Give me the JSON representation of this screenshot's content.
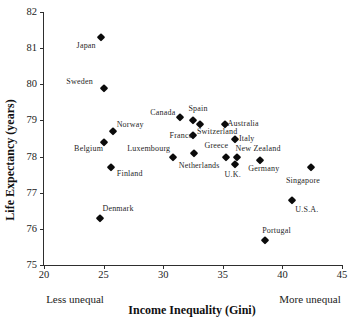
{
  "chart_data": {
    "type": "scatter",
    "title": "",
    "xlabel": "Income Inequality (Gini)",
    "ylabel": "Life Expectancy (years)",
    "x_annotation_left": "Less unequal",
    "x_annotation_right": "More unequal",
    "xlim": [
      20,
      45
    ],
    "ylim": [
      75,
      82
    ],
    "x_ticks": [
      20,
      25,
      30,
      35,
      40,
      45
    ],
    "y_ticks": [
      75,
      76,
      77,
      78,
      79,
      80,
      81,
      82
    ],
    "grid": false,
    "legend": false,
    "marker": {
      "shape": "diamond",
      "color": "#0b0b0b"
    },
    "axis_color": "#2e2e2e",
    "points": [
      {
        "country": "Japan",
        "gini": 24.8,
        "life_expectancy": 81.3,
        "label_dx": -15,
        "label_dy": 9
      },
      {
        "country": "Sweden",
        "gini": 25.0,
        "life_expectancy": 79.9,
        "label_dx": -24,
        "label_dy": -6
      },
      {
        "country": "Norway",
        "gini": 25.8,
        "life_expectancy": 78.7,
        "label_dx": 17,
        "label_dy": -6
      },
      {
        "country": "Belgium",
        "gini": 25.0,
        "life_expectancy": 78.4,
        "label_dx": -15,
        "label_dy": 7
      },
      {
        "country": "Finland",
        "gini": 25.6,
        "life_expectancy": 77.7,
        "label_dx": 19,
        "label_dy": 7
      },
      {
        "country": "Denmark",
        "gini": 24.7,
        "life_expectancy": 76.3,
        "label_dx": 18,
        "label_dy": -9
      },
      {
        "country": "Canada",
        "gini": 31.4,
        "life_expectancy": 79.1,
        "label_dx": -17,
        "label_dy": -4
      },
      {
        "country": "Spain",
        "gini": 32.5,
        "life_expectancy": 79.0,
        "label_dx": 5,
        "label_dy": -11
      },
      {
        "country": "Switzerland",
        "gini": 33.1,
        "life_expectancy": 78.9,
        "label_dx": 17,
        "label_dy": 8
      },
      {
        "country": "France",
        "gini": 32.5,
        "life_expectancy": 78.6,
        "label_dx": -12,
        "label_dy": 1
      },
      {
        "country": "Australia",
        "gini": 35.2,
        "life_expectancy": 78.9,
        "label_dx": 18,
        "label_dy": 0
      },
      {
        "country": "Italy",
        "gini": 36.0,
        "life_expectancy": 78.5,
        "label_dx": 12,
        "label_dy": 0
      },
      {
        "country": "Luxembourg",
        "gini": 30.8,
        "life_expectancy": 78.0,
        "label_dx": -24,
        "label_dy": -8
      },
      {
        "country": "Netherlands",
        "gini": 32.6,
        "life_expectancy": 78.1,
        "label_dx": 5,
        "label_dy": 13
      },
      {
        "country": "Greece",
        "gini": 35.3,
        "life_expectancy": 78.0,
        "label_dx": -10,
        "label_dy": -11
      },
      {
        "country": "New Zealand",
        "gini": 36.2,
        "life_expectancy": 78.0,
        "label_dx": 21,
        "label_dy": -8
      },
      {
        "country": "U.K.",
        "gini": 36.0,
        "life_expectancy": 77.8,
        "label_dx": -2,
        "label_dy": 11
      },
      {
        "country": "Germany",
        "gini": 38.1,
        "life_expectancy": 77.9,
        "label_dx": 4,
        "label_dy": 9
      },
      {
        "country": "Singapore",
        "gini": 42.4,
        "life_expectancy": 77.7,
        "label_dx": -8,
        "label_dy": 14
      },
      {
        "country": "U.S.A.",
        "gini": 40.8,
        "life_expectancy": 76.8,
        "label_dx": 15,
        "label_dy": 10
      },
      {
        "country": "Portugal",
        "gini": 38.5,
        "life_expectancy": 75.7,
        "label_dx": 12,
        "label_dy": -9
      }
    ]
  }
}
